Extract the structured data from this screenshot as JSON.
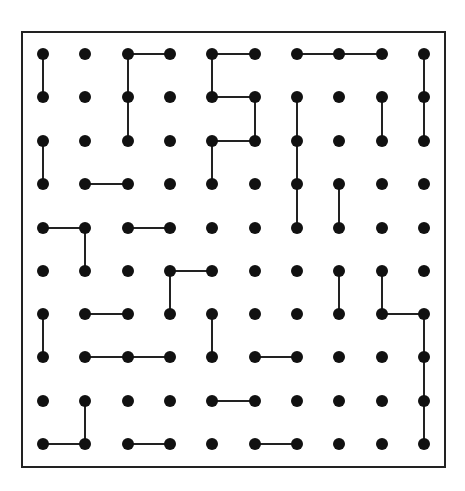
{
  "puzzle": {
    "type": "dot-grid-line-segments",
    "rows": 10,
    "cols": 10,
    "frame": {
      "x": 22,
      "y": 32,
      "width": 423,
      "height": 435,
      "stroke": "#222222"
    },
    "dot_color": "#111111",
    "line_color": "#222222",
    "col_x": [
      43,
      85,
      128,
      170,
      212,
      255,
      297,
      339,
      382,
      424
    ],
    "row_y": [
      54,
      97,
      141,
      184,
      228,
      271,
      314,
      357,
      401,
      444
    ],
    "edges": [
      [
        [
          0,
          2
        ],
        [
          0,
          3
        ]
      ],
      [
        [
          0,
          4
        ],
        [
          0,
          5
        ]
      ],
      [
        [
          0,
          6
        ],
        [
          0,
          7
        ]
      ],
      [
        [
          0,
          7
        ],
        [
          0,
          8
        ]
      ],
      [
        [
          0,
          0
        ],
        [
          1,
          0
        ]
      ],
      [
        [
          0,
          2
        ],
        [
          1,
          2
        ]
      ],
      [
        [
          0,
          4
        ],
        [
          1,
          4
        ]
      ],
      [
        [
          0,
          9
        ],
        [
          1,
          9
        ]
      ],
      [
        [
          1,
          4
        ],
        [
          1,
          5
        ]
      ],
      [
        [
          1,
          2
        ],
        [
          2,
          2
        ]
      ],
      [
        [
          1,
          5
        ],
        [
          2,
          5
        ]
      ],
      [
        [
          1,
          6
        ],
        [
          2,
          6
        ]
      ],
      [
        [
          1,
          8
        ],
        [
          2,
          8
        ]
      ],
      [
        [
          1,
          9
        ],
        [
          2,
          9
        ]
      ],
      [
        [
          2,
          4
        ],
        [
          2,
          5
        ]
      ],
      [
        [
          2,
          0
        ],
        [
          3,
          0
        ]
      ],
      [
        [
          2,
          4
        ],
        [
          3,
          4
        ]
      ],
      [
        [
          2,
          6
        ],
        [
          3,
          6
        ]
      ],
      [
        [
          3,
          1
        ],
        [
          3,
          2
        ]
      ],
      [
        [
          3,
          6
        ],
        [
          4,
          6
        ]
      ],
      [
        [
          3,
          7
        ],
        [
          4,
          7
        ]
      ],
      [
        [
          4,
          0
        ],
        [
          4,
          1
        ]
      ],
      [
        [
          4,
          2
        ],
        [
          4,
          3
        ]
      ],
      [
        [
          4,
          1
        ],
        [
          5,
          1
        ]
      ],
      [
        [
          5,
          3
        ],
        [
          5,
          4
        ]
      ],
      [
        [
          5,
          3
        ],
        [
          6,
          3
        ]
      ],
      [
        [
          5,
          7
        ],
        [
          6,
          7
        ]
      ],
      [
        [
          5,
          8
        ],
        [
          6,
          8
        ]
      ],
      [
        [
          6,
          1
        ],
        [
          6,
          2
        ]
      ],
      [
        [
          6,
          8
        ],
        [
          6,
          9
        ]
      ],
      [
        [
          6,
          0
        ],
        [
          7,
          0
        ]
      ],
      [
        [
          6,
          4
        ],
        [
          7,
          4
        ]
      ],
      [
        [
          6,
          9
        ],
        [
          7,
          9
        ]
      ],
      [
        [
          7,
          1
        ],
        [
          7,
          2
        ]
      ],
      [
        [
          7,
          2
        ],
        [
          7,
          3
        ]
      ],
      [
        [
          7,
          5
        ],
        [
          7,
          6
        ]
      ],
      [
        [
          7,
          9
        ],
        [
          8,
          9
        ]
      ],
      [
        [
          8,
          4
        ],
        [
          8,
          5
        ]
      ],
      [
        [
          8,
          1
        ],
        [
          9,
          1
        ]
      ],
      [
        [
          8,
          9
        ],
        [
          9,
          9
        ]
      ],
      [
        [
          9,
          0
        ],
        [
          9,
          1
        ]
      ],
      [
        [
          9,
          2
        ],
        [
          9,
          3
        ]
      ],
      [
        [
          9,
          5
        ],
        [
          9,
          6
        ]
      ]
    ]
  }
}
